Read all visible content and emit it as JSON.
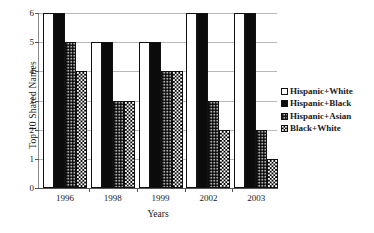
{
  "chart_data": {
    "type": "bar",
    "title": "",
    "xlabel": "Years",
    "ylabel": "Top 10 Shared Names",
    "categories": [
      "1996",
      "1998",
      "1999",
      "2002",
      "2003"
    ],
    "series": [
      {
        "name": "Hispanic+White",
        "values": [
          6,
          5,
          5,
          6,
          6
        ],
        "fill": "white"
      },
      {
        "name": "Hispanic+Black",
        "values": [
          6,
          5,
          5,
          6,
          6
        ],
        "fill": "solid-black"
      },
      {
        "name": "Hispanic+Asian",
        "values": [
          5,
          3,
          4,
          3,
          2
        ],
        "fill": "fine-grey-stipple"
      },
      {
        "name": "Black+White",
        "values": [
          4,
          3,
          4,
          2,
          1
        ],
        "fill": "checkerboard"
      }
    ],
    "ylim": [
      0,
      6
    ],
    "yticks": [
      "0",
      "1",
      "2",
      "3",
      "4",
      "5",
      "6"
    ],
    "grid": "horizontal",
    "legend_position": "right"
  },
  "legend": {
    "entries": [
      {
        "label": "Hispanic+White"
      },
      {
        "label": "Hispanic+Black"
      },
      {
        "label": "Hispanic+Asian"
      },
      {
        "label": "Black+White"
      }
    ]
  }
}
